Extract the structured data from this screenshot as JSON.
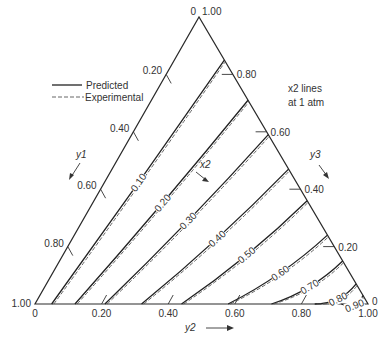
{
  "chart_data": {
    "type": "ternary-contour",
    "title": "",
    "annotation": [
      "x2 lines",
      "at 1 atm"
    ],
    "legend": {
      "placement": "top-left",
      "entries": [
        {
          "name": "Predicted",
          "style": "solid"
        },
        {
          "name": "Experimental",
          "style": "dashed"
        }
      ]
    },
    "axes": {
      "y1": {
        "label": "y1",
        "ticks": [
          "0",
          "0.20",
          "0.40",
          "0.60",
          "0.80",
          "1.00"
        ],
        "values": [
          0,
          0.2,
          0.4,
          0.6,
          0.8,
          1.0
        ],
        "side": "left",
        "direction": "down"
      },
      "y2": {
        "label": "y2",
        "ticks": [
          "0",
          "0.20",
          "0.40",
          "0.60",
          "0.80",
          "1.00"
        ],
        "values": [
          0,
          0.2,
          0.4,
          0.6,
          0.8,
          1.0
        ],
        "side": "bottom",
        "direction": "right"
      },
      "y3": {
        "label": "y3",
        "ticks": [
          "1.00",
          "0.80",
          "0.60",
          "0.40",
          "0.20",
          "0"
        ],
        "values": [
          1.0,
          0.8,
          0.6,
          0.4,
          0.2,
          0
        ],
        "side": "right",
        "direction": "down"
      }
    },
    "x2_label": "x2",
    "contours": [
      {
        "label": "0.10",
        "x2": 0.1,
        "start_y2": 0.05,
        "end_y3": 0.85
      },
      {
        "label": "0.20",
        "x2": 0.2,
        "start_y2": 0.12,
        "end_y3": 0.71
      },
      {
        "label": "0.30",
        "x2": 0.3,
        "start_y2": 0.21,
        "end_y3": 0.59
      },
      {
        "label": "0.40",
        "x2": 0.4,
        "start_y2": 0.32,
        "end_y3": 0.47
      },
      {
        "label": "0.50",
        "x2": 0.5,
        "start_y2": 0.44,
        "end_y3": 0.36
      },
      {
        "label": "0.60",
        "x2": 0.6,
        "start_y2": 0.58,
        "end_y3": 0.24
      },
      {
        "label": "0.70",
        "x2": 0.7,
        "start_y2": 0.71,
        "end_y3": 0.15
      },
      {
        "label": "0.80",
        "x2": 0.8,
        "start_y2": 0.84,
        "end_y3": 0.07
      },
      {
        "label": "0.90",
        "x2": 0.9,
        "start_y2": 0.92,
        "end_y3": 0.03
      }
    ]
  }
}
